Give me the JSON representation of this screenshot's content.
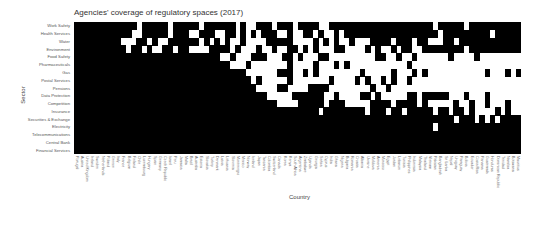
{
  "chart_data": {
    "type": "heatmap",
    "title": "Agencies' coverage of regulatory spaces (2017)",
    "xlabel": "Country",
    "ylabel": "Sector",
    "colors": {
      "covered": "#000000",
      "not_covered": "#ffffff"
    },
    "legend": "none",
    "rows": [
      "Work Safety",
      "Health Services",
      "Water",
      "Environment",
      "Food Safety",
      "Pharmaceuticals",
      "Gas",
      "Postal Services",
      "Pensions",
      "Data Protection",
      "Competition",
      "Insurance",
      "Securities & Exchange",
      "Electricity",
      "Telecommunications",
      "Central Bank",
      "Financial Services"
    ],
    "columns": [
      "Portugal",
      "Austria",
      "United Kingdom",
      "Ireland",
      "Sweden",
      "Netherlands",
      "Poland",
      "Greece",
      "Italy",
      "France",
      "Belgium",
      "Finland",
      "Chile",
      "Luxembourg",
      "Hungary",
      "Spain",
      "Germany",
      "Czech Republic",
      "Israel",
      "Peru",
      "Jamaica",
      "Malta",
      "Brazil",
      "Australia",
      "Estonia",
      "Slovakia",
      "Turkey",
      "Denmark",
      "Latvia",
      "Lithuania",
      "Slovenia",
      "Montenegro",
      "Mexico",
      "Norway",
      "Iceland",
      "Japan",
      "Tanzania",
      "Colombia",
      "Switzerland",
      "Canada",
      "Korea",
      "Kenya",
      "South Africa",
      "Argentina",
      "Zimbabwe",
      "Uganda",
      "Georgia",
      "Serbia",
      "Cyprus",
      "India",
      "Ghana",
      "Nigeria",
      "Bulgaria",
      "Romania",
      "Croatia",
      "Albania",
      "Ukraine",
      "Moldova",
      "Armenia",
      "Morocco",
      "Egypt",
      "Jordan",
      "Lebanon",
      "Tunisia",
      "Philippines",
      "Indonesia",
      "Malaysia",
      "Thailand",
      "Vietnam",
      "Pakistan",
      "Bangladesh",
      "Sri Lanka",
      "Nepal",
      "Uruguay",
      "Paraguay",
      "Bolivia",
      "Ecuador",
      "Costa Rica",
      "Panama",
      "Guatemala",
      "Honduras",
      "Dominican Republic",
      "Trinidad",
      "Namibia",
      "Botswana",
      "Mauritius"
    ],
    "matrix": [
      "11111111111101111101111101111110100111011101111001111111111111111111101111101111111111111",
      "11111111111001111101110011100110101011100100110100101111111111111111110111111111011111111",
      "11111111100011010011111101010100100001111100001010100100011110111011000110111111111111111",
      "11111111110110100110110000111101000100100110101000110000101001011001111111101111111111111",
      "11111111111111111111111111110010001110001101000110000000001100100100000010000100000000000",
      "11111111111111111111111111111100010000000100001000101000000000001000000000000000000000000",
      "11111111111111111111111111111111100000011100101000000001000001000101000000000001000101000",
      "11111111111111111111111111111111110100000100000001000010100101001000000000000000000000000",
      "11111111111111111111111111111111111000011000011110000000010010000000000000000000000000000",
      "11111111111111111111111111111111111110000011111100100001101000001101111100010001000000000",
      "11111111111111111111111111111111111111100001111101110000011110111101000001001001000100000",
      "11111111111111111111111111111111111111111111111011111111011101101111101101101000010100000",
      "11111111111111111111111111111111111111111111111111111111111111111111111110111010101111100",
      "11111111111111111111111111111111111111111111111111111111111111111111101111111111111111110",
      "11111111111111111111111111111111111111111111111111111111111111111111111111111111111111111",
      "11111111111111111111111111111111111111111111111111111111111111111111111111111111111111111",
      "11111111111111111111111111111111111111111111111111111111111111111111111111111111111111111"
    ]
  },
  "title": "Agencies' coverage of regulatory spaces (2017)",
  "xaxis_title": "Country",
  "yaxis_title": "Sector"
}
